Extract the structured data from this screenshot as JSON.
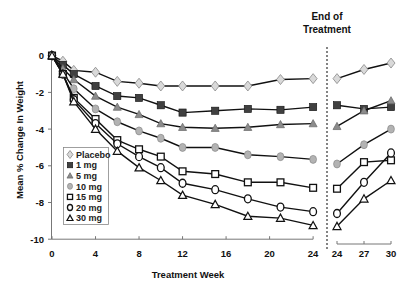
{
  "chart_data": {
    "type": "line",
    "title": "",
    "annotation": [
      "End of",
      "Treatment"
    ],
    "xlabel": "Treatment Week",
    "ylabel": "Mean % Change In Weight",
    "ylim": [
      -10,
      0
    ],
    "yticks": [
      0,
      -2,
      -4,
      -6,
      -8,
      -10
    ],
    "grid": false,
    "legend_position": "lower-left inside",
    "panels": [
      {
        "name": "treatment",
        "xlim": [
          0,
          24
        ],
        "xticks": [
          0,
          4,
          8,
          12,
          16,
          20,
          24
        ],
        "x": [
          0,
          1,
          2,
          4,
          6,
          8,
          10,
          12,
          15,
          18,
          21,
          24
        ]
      },
      {
        "name": "end-of-treatment",
        "xticks": [
          24,
          27,
          30
        ],
        "x": [
          24,
          27,
          30
        ]
      }
    ],
    "series": [
      {
        "name": "Placebo",
        "marker": "diamond",
        "fill": "#d9d9d9",
        "values": [
          0,
          -0.3,
          -0.8,
          -0.9,
          -1.4,
          -1.5,
          -1.65,
          -1.65,
          -1.65,
          -1.65,
          -1.3,
          -1.25
        ],
        "post_values": [
          -1.25,
          -0.75,
          -0.4
        ]
      },
      {
        "name": "1 mg",
        "marker": "square",
        "fill": "#404040",
        "values": [
          0,
          -0.5,
          -1.0,
          -1.65,
          -2.2,
          -2.3,
          -2.7,
          -3.1,
          -3.0,
          -2.9,
          -2.95,
          -2.8
        ],
        "post_values": [
          -2.7,
          -2.9,
          -2.8
        ]
      },
      {
        "name": "5 mg",
        "marker": "triangle",
        "fill": "#8c8c8c",
        "values": [
          0,
          -0.7,
          -1.3,
          -2.2,
          -2.8,
          -3.2,
          -3.7,
          -3.9,
          -3.95,
          -3.9,
          -3.75,
          -3.7
        ],
        "post_values": [
          -3.85,
          -3.0,
          -2.45
        ]
      },
      {
        "name": "10 mg",
        "marker": "circle",
        "fill": "#b3b3b3",
        "values": [
          0,
          -0.9,
          -1.8,
          -2.9,
          -3.6,
          -4.1,
          -4.5,
          -5.0,
          -5.0,
          -5.4,
          -5.5,
          -5.65
        ],
        "post_values": [
          -5.9,
          -4.85,
          -4.0
        ]
      },
      {
        "name": "15 mg",
        "marker": "open-square",
        "fill": "#ffffff",
        "values": [
          0,
          -1.0,
          -2.3,
          -3.45,
          -4.6,
          -5.1,
          -5.5,
          -6.3,
          -6.45,
          -6.9,
          -6.9,
          -7.2
        ],
        "post_values": [
          -7.25,
          -5.8,
          -5.7
        ]
      },
      {
        "name": "20 mg",
        "marker": "open-circle",
        "fill": "#ffffff",
        "values": [
          0,
          -1.0,
          -2.4,
          -3.7,
          -4.8,
          -5.5,
          -6.1,
          -6.95,
          -7.3,
          -7.8,
          -8.25,
          -8.5
        ],
        "post_values": [
          -8.6,
          -6.9,
          -5.3
        ]
      },
      {
        "name": "30 mg",
        "marker": "open-triangle",
        "fill": "#ffffff",
        "values": [
          0,
          -1.0,
          -2.5,
          -4.0,
          -5.2,
          -6.1,
          -6.8,
          -7.6,
          -8.1,
          -8.75,
          -8.85,
          -9.25
        ],
        "post_values": [
          -9.3,
          -7.8,
          -6.8
        ]
      }
    ]
  }
}
